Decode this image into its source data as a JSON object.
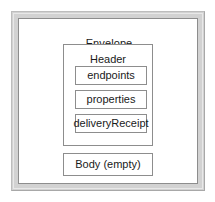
{
  "diagram": {
    "type": "nested-box-diagram",
    "frame": {
      "border_color": "#8d8d8d",
      "band_color": "#d2d2d2",
      "background": "#ffffff"
    },
    "envelope": {
      "title": "Envelope",
      "header": {
        "title": "Header",
        "fields": [
          {
            "label": "endpoints"
          },
          {
            "label": "properties"
          },
          {
            "label": "deliveryReceipt"
          }
        ]
      },
      "body": {
        "label": "Body (empty)"
      }
    }
  }
}
